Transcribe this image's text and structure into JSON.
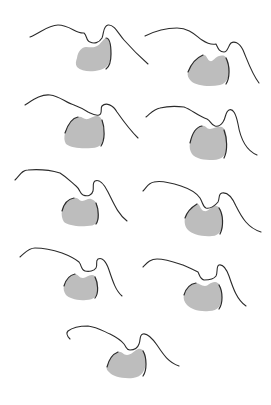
{
  "figure": {
    "width": 271,
    "height": 405,
    "background": "#ffffff",
    "stroke_color": "#2b2b2b",
    "blob_color": "#bdbdbd",
    "panels": [
      {
        "id": 1,
        "curve": "M30,37 C40,33 48,25 58,25 C70,25 76,34 84,33 C87,35 86,41 90,42 C94,44 99,43 102,38 C104,33 103,26 108,25 C114,24 118,33 124,40 C132,49 140,57 148,64",
        "blob": "M77,58 C78,51 82,47 86,47 C90,47 94,48 97,46 C101,44 102,40 106,38 C110,38 111,46 111,54 C111,62 108,68 100,70 C92,72 82,72 77,67 C75,64 76,61 77,58 Z",
        "edge": "M106,38 C110,38 111,46 111,54 C111,62 109,67 106,69"
      },
      {
        "id": 2,
        "curve": "M145,36 C155,31 165,28 177,28 C190,28 196,36 202,40 C208,44 212,45 216,44 C218,48 219,52 224,52 C228,52 228,46 231,43 C234,41 239,42 243,50 C248,62 252,74 259,83",
        "blob": "M188,72 C191,64 196,58 203,55 C207,54 207,60 210,61 C213,62 215,57 219,56 C223,55 227,55 229,64 C231,74 228,83 220,85 C210,87 196,86 191,81 C188,78 187,75 188,72 Z",
        "edge": "M188,72 C191,64 196,58 203,55 M226,58 C230,66 230,78 226,84"
      },
      {
        "id": 3,
        "curve": "M25,105 C33,100 41,94 50,95 C60,96 66,103 74,105 C82,108 85,110 88,112 C92,114 95,116 99,115 C103,114 100,108 102,106 C106,102 113,105 117,112 C124,122 130,130 138,138",
        "blob": "M65,133 C68,124 72,118 78,117 C82,116 84,120 88,119 C92,118 95,115 98,116 C102,117 104,124 104,133 C104,143 100,148 92,148 C82,149 71,148 66,144 C64,141 64,137 65,133 Z",
        "edge": "M65,133 C68,124 72,118 78,117 M102,120 C105,128 105,140 101,146"
      },
      {
        "id": 4,
        "curve": "M146,117 C151,113 154,109 160,108 C168,106 176,106 184,107 C192,110 198,116 207,119 C211,121 211,125 215,126 C219,127 221,125 223,122 C226,118 225,112 229,110 C233,108 236,114 238,124 C240,136 245,150 257,155",
        "blob": "M190,143 C192,134 196,127 202,126 C206,125 206,129 210,129 C214,129 217,126 222,127 C226,129 227,135 227,145 C227,155 222,160 213,160 C204,160 196,159 192,154 C190,151 189,147 190,143 Z",
        "edge": "M190,143 C192,134 196,127 202,126 M224,130 C227,138 228,150 224,158"
      },
      {
        "id": 5,
        "curve": "M15,180 C20,175 22,170 28,170 C40,169 50,170 60,173 C68,178 72,183 76,186 C80,189 80,194 83,195 C88,197 92,195 93,191 C94,187 92,183 95,181 C99,179 104,184 108,192 C114,204 118,214 127,221",
        "blob": "M62,211 C64,203 68,199 74,198 C78,197 79,201 82,201 C86,201 88,198 91,199 C96,200 99,207 99,214 C99,223 95,226 87,226 C77,227 68,225 64,222 C62,219 61,214 62,211 Z",
        "edge": "M62,211 C64,203 68,199 74,198 M96,203 C99,210 99,220 96,224"
      },
      {
        "id": 6,
        "curve": "M143,191 C147,187 148,183 154,182 C162,180 172,183 181,186 C190,189 196,192 200,198 C203,203 203,207 206,208 C210,209 215,206 218,202 C220,198 218,194 222,193 C227,192 232,197 236,206 C242,218 248,228 261,232",
        "blob": "M185,218 C187,212 192,207 197,204 C200,203 200,210 204,211 C208,212 211,207 214,206 C218,205 222,208 223,218 C224,228 220,236 212,236 C202,237 192,234 188,230 C185,227 184,222 185,218 Z",
        "edge": "M185,218 C187,212 192,207 197,204 M219,208 C223,214 224,226 220,234"
      },
      {
        "id": 7,
        "curve": "M20,257 C25,253 28,248 35,248 C44,248 53,250 62,253 C70,256 74,258 79,262 C82,266 81,270 85,271 C89,272 94,271 96,268 C98,265 95,261 98,259 C102,257 106,261 109,270 C113,282 116,291 122,296",
        "blob": "M64,286 C66,279 70,275 75,274 C78,274 79,278 83,278 C86,278 88,275 92,275 C96,275 98,280 98,288 C98,296 94,300 86,300 C77,301 69,298 66,295 C64,292 63,289 64,286 Z",
        "edge": "M64,286 C66,279 70,275 75,274 M95,277 C98,283 99,293 95,298"
      },
      {
        "id": 8,
        "curve": "M143,267 C147,263 150,259 157,259 C166,259 174,262 183,265 C190,268 194,270 198,272 C200,276 200,279 204,280 C208,280 214,279 216,276 C218,272 216,266 219,265 C223,264 226,268 229,276 C233,288 237,300 246,306",
        "blob": "M184,295 C186,288 190,284 196,283 C199,283 201,286 205,286 C208,286 210,282 215,282 C219,282 222,287 222,296 C222,305 218,311 209,311 C199,312 191,309 187,305 C184,302 183,298 184,295 Z",
        "edge": "M184,295 C186,288 190,284 196,283 M219,285 C223,292 223,303 219,309"
      },
      {
        "id": 9,
        "curve": "M70,339 C67,336 66,333 68,331 C73,327 80,326 88,326 C97,327 103,331 110,334 C116,337 120,339 124,344 C127,348 126,350 130,350 C135,350 138,347 139,344 C141,339 139,335 143,334 C147,333 152,338 157,345 C163,354 168,362 179,366",
        "blob": "M107,367 C109,359 113,354 118,352 C122,351 123,355 127,355 C131,355 134,351 138,349 C142,348 146,351 146,360 C146,370 142,377 133,378 C122,379 112,376 109,372 C107,370 106,369 107,367 Z",
        "edge": "M107,367 C109,359 113,354 118,352 M143,351 C147,358 147,370 143,376"
      }
    ]
  }
}
